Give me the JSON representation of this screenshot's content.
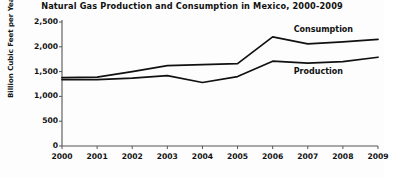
{
  "chart_data": {
    "type": "line",
    "title": "Natural Gas Production and Consumption in Mexico, 2000-2009",
    "xlabel": "",
    "ylabel": "Billion Cubic Feet per Year",
    "x": [
      2000,
      2001,
      2002,
      2003,
      2004,
      2005,
      2006,
      2007,
      2008,
      2009
    ],
    "categories": [
      "2000",
      "2001",
      "2002",
      "2003",
      "2004",
      "2005",
      "2006",
      "2007",
      "2008",
      "2009"
    ],
    "ylim": [
      0,
      2500
    ],
    "yticks": [
      0,
      500,
      1000,
      1500,
      2000,
      2500
    ],
    "ytick_labels": [
      "0",
      "500",
      "1,000",
      "1,500",
      "2,000",
      "2,500"
    ],
    "grid": false,
    "legend": "inline-series-labels",
    "series": [
      {
        "name": "Consumption",
        "values": [
          1380,
          1390,
          1500,
          1620,
          1640,
          1660,
          2200,
          2060,
          2100,
          2150
        ],
        "color": "#111111",
        "label_x": 2006.6,
        "label_y": 2330
      },
      {
        "name": "Production",
        "values": [
          1340,
          1340,
          1370,
          1420,
          1280,
          1400,
          1710,
          1670,
          1700,
          1790
        ],
        "color": "#111111",
        "label_x": 2006.6,
        "label_y": 1500
      }
    ],
    "annotations": [
      {
        "text": "Consumption",
        "series": "Consumption"
      },
      {
        "text": "Production",
        "series": "Production"
      }
    ]
  },
  "axes": {
    "axis_color": "#555555",
    "line_color": "#111111"
  }
}
